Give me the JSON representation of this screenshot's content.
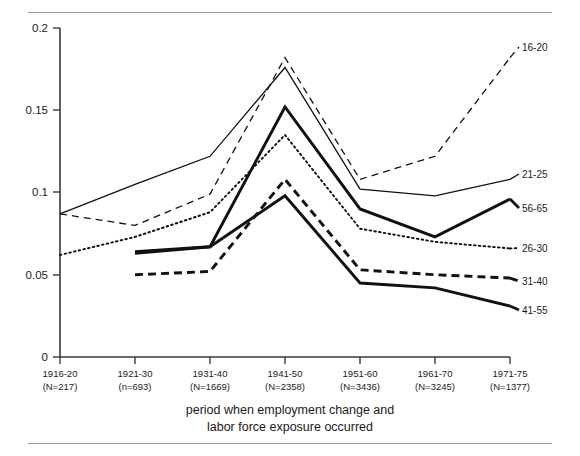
{
  "figure": {
    "caption_line1": "period when employment change and",
    "caption_line2": "labor force exposure occurred"
  },
  "chart_data": {
    "type": "line",
    "title": "",
    "xlabel": "period when employment change and labor force exposure occurred",
    "ylabel": "",
    "ylim": [
      0,
      0.2
    ],
    "yticks": [
      0,
      0.05,
      0.1,
      0.15,
      0.2
    ],
    "ytick_labels": [
      "0",
      "0.05",
      "0.1",
      "0.15",
      "0.2"
    ],
    "grid": false,
    "legend_position": "right-inline-labels",
    "categories": [
      "1916-20",
      "1921-30",
      "1931-40",
      "1941-50",
      "1951-60",
      "1961-70",
      "1971-75"
    ],
    "category_counts": [
      "(N=217)",
      "(n=693)",
      "(N=1669)",
      "(N=2358)",
      "(N=3436)",
      "(N=3245)",
      "(N=1377)"
    ],
    "xtick_labels": [
      {
        "period": "1916-20",
        "n": "(N=217)"
      },
      {
        "period": "1921-30",
        "n": "(n=693)"
      },
      {
        "period": "1931-40",
        "n": "(N=1669)"
      },
      {
        "period": "1941-50",
        "n": "(N=2358)"
      },
      {
        "period": "1951-60",
        "n": "(N=3436)"
      },
      {
        "period": "1961-70",
        "n": "(N=3245)"
      },
      {
        "period": "1971-75",
        "n": "(N=1377)"
      }
    ],
    "series": [
      {
        "name": "16-20",
        "style": "dashed-thin",
        "values": [
          0.087,
          0.08,
          0.099,
          0.182,
          0.108,
          0.122,
          0.182
        ]
      },
      {
        "name": "21-25",
        "style": "solid-thin",
        "values": [
          0.087,
          0.105,
          0.122,
          0.176,
          0.102,
          0.098,
          0.108
        ]
      },
      {
        "name": "26-30",
        "style": "dotted-thin",
        "values": [
          0.062,
          0.073,
          0.088,
          0.135,
          0.078,
          0.07,
          0.066
        ]
      },
      {
        "name": "56-65",
        "style": "solid-thick",
        "values": [
          null,
          0.063,
          0.067,
          0.152,
          0.09,
          0.073,
          0.096
        ]
      },
      {
        "name": "31-40",
        "style": "dashed-thick",
        "values": [
          null,
          0.05,
          0.052,
          0.108,
          0.053,
          0.05,
          0.048
        ]
      },
      {
        "name": "41-55",
        "style": "solid-thick-2",
        "values": [
          null,
          0.064,
          0.067,
          0.098,
          0.045,
          0.042,
          0.031
        ]
      }
    ]
  }
}
